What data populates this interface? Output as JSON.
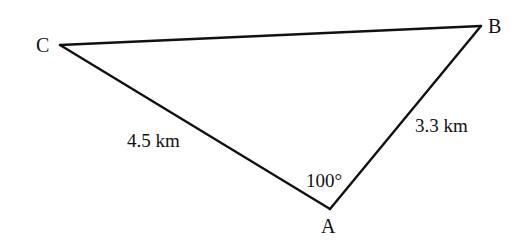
{
  "diagram": {
    "type": "triangle",
    "stroke_color": "#111111",
    "background": "#ffffff",
    "vertices": {
      "A": {
        "label": "A"
      },
      "B": {
        "label": "B"
      },
      "C": {
        "label": "C"
      }
    },
    "sides": {
      "CA": {
        "label": "4.5 km",
        "length": 4.5,
        "unit": "km"
      },
      "AB": {
        "label": "3.3 km",
        "length": 3.3,
        "unit": "km"
      },
      "CB": {
        "label": ""
      }
    },
    "angles": {
      "A": {
        "label": "100°",
        "value": 100,
        "unit": "degrees"
      }
    }
  }
}
